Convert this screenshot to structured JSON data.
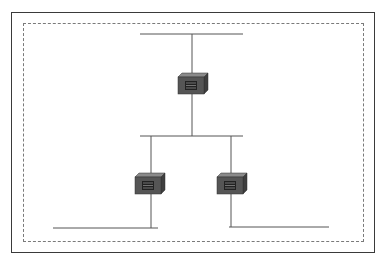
{
  "diagram": {
    "type": "network-topology",
    "colors": {
      "frame": "#3a3a3a",
      "dashed_boundary": "#7a7a7a",
      "line": "#555555",
      "device_front": "#555555",
      "device_top": "#8a8a8a",
      "device_side": "#3e3e3e"
    },
    "segments": [
      {
        "id": "top-segment",
        "x1": 140,
        "y1": 34,
        "x2": 243,
        "y2": 34
      },
      {
        "id": "middle-segment",
        "x1": 140,
        "y1": 136,
        "x2": 243,
        "y2": 136
      },
      {
        "id": "bottom-left-segment",
        "x1": 53,
        "y1": 228,
        "x2": 158,
        "y2": 228
      },
      {
        "id": "bottom-right-segment",
        "x1": 229,
        "y1": 227,
        "x2": 329,
        "y2": 227
      }
    ],
    "devices": [
      {
        "id": "router-top",
        "x": 178,
        "y": 73
      },
      {
        "id": "router-left",
        "x": 135,
        "y": 173
      },
      {
        "id": "router-right",
        "x": 217,
        "y": 173
      }
    ],
    "links": [
      {
        "x1": 192,
        "y1": 34,
        "x2": 192,
        "y2": 73
      },
      {
        "x1": 192,
        "y1": 93,
        "x2": 192,
        "y2": 136
      },
      {
        "x1": 151,
        "y1": 136,
        "x2": 151,
        "y2": 173
      },
      {
        "x1": 231,
        "y1": 136,
        "x2": 231,
        "y2": 173
      },
      {
        "x1": 151,
        "y1": 192,
        "x2": 151,
        "y2": 228
      },
      {
        "x1": 231,
        "y1": 192,
        "x2": 231,
        "y2": 227
      }
    ]
  }
}
